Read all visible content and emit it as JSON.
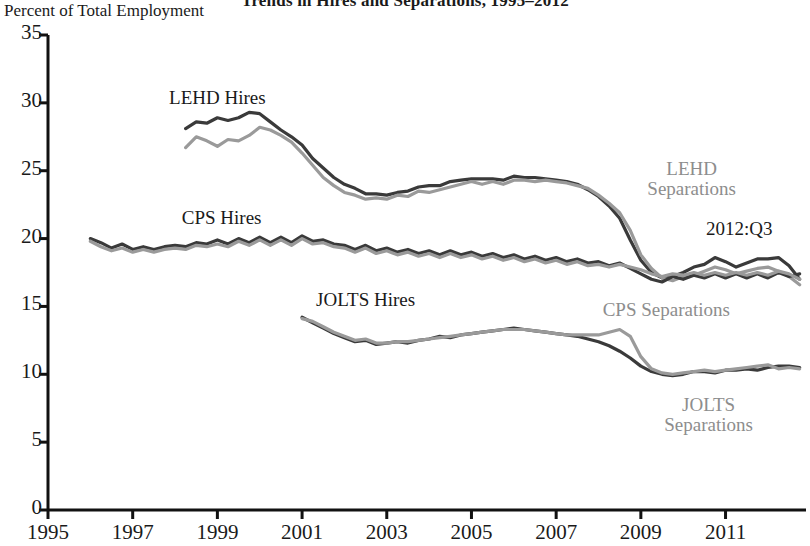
{
  "chart_data": {
    "type": "line",
    "title": "Trends in Hires and Separations, 1995–2012",
    "ylabel": "Percent of Total Employment",
    "xlabel": "",
    "xlim": [
      1995,
      2012.9
    ],
    "ylim": [
      0,
      35
    ],
    "yticks": [
      0,
      5,
      10,
      15,
      20,
      25,
      30,
      35
    ],
    "xticks": [
      1995,
      1997,
      1999,
      2001,
      2003,
      2005,
      2007,
      2009,
      2011
    ],
    "ytick_labels": [
      "0",
      "5",
      "10",
      "15",
      "20",
      "25",
      "30",
      "35"
    ],
    "xtick_labels": [
      "1995",
      "1997",
      "1999",
      "2001",
      "2003",
      "2005",
      "2007",
      "2009",
      "2011"
    ],
    "grid": false,
    "legend_position": "inline-annotations",
    "colors": {
      "hires": "#3a3a3a",
      "separations": "#9a9a9a",
      "axis": "#111111"
    },
    "annotations": [
      {
        "text": "2012:Q3",
        "x": 2011.6,
        "y": 20.6,
        "color": "#1a1a1a"
      }
    ],
    "series": [
      {
        "name": "LEHD Hires",
        "color": "#3a3a3a",
        "label_x": 1999.0,
        "label_y": 30.2,
        "x": [
          1998.25,
          1998.5,
          1998.75,
          1999.0,
          1999.25,
          1999.5,
          1999.75,
          2000.0,
          2000.25,
          2000.5,
          2000.75,
          2001.0,
          2001.25,
          2001.5,
          2001.75,
          2002.0,
          2002.25,
          2002.5,
          2002.75,
          2003.0,
          2003.25,
          2003.5,
          2003.75,
          2004.0,
          2004.25,
          2004.5,
          2004.75,
          2005.0,
          2005.25,
          2005.5,
          2005.75,
          2006.0,
          2006.25,
          2006.5,
          2006.75,
          2007.0,
          2007.25,
          2007.5,
          2007.75,
          2008.0,
          2008.25,
          2008.5,
          2008.75,
          2009.0,
          2009.25,
          2009.5,
          2009.75,
          2010.0,
          2010.25,
          2010.5,
          2010.75,
          2011.0,
          2011.25,
          2011.5,
          2011.75,
          2012.0,
          2012.25,
          2012.5,
          2012.75
        ],
        "y": [
          28.1,
          28.6,
          28.5,
          28.9,
          28.7,
          28.9,
          29.3,
          29.2,
          28.6,
          28.0,
          27.5,
          26.9,
          25.9,
          25.2,
          24.5,
          24.0,
          23.7,
          23.3,
          23.3,
          23.2,
          23.4,
          23.5,
          23.8,
          23.9,
          23.9,
          24.2,
          24.3,
          24.4,
          24.4,
          24.4,
          24.3,
          24.6,
          24.5,
          24.5,
          24.4,
          24.3,
          24.2,
          24.0,
          23.6,
          23.1,
          22.4,
          21.5,
          19.9,
          18.4,
          17.5,
          17.1,
          17.2,
          17.5,
          17.9,
          18.1,
          18.6,
          18.3,
          17.9,
          18.2,
          18.5,
          18.5,
          18.6,
          18.0,
          17.0
        ]
      },
      {
        "name": "LEHD Separations",
        "color": "#9a9a9a",
        "label_x": 2010.2,
        "label_y": 25.0,
        "label_lines": [
          "LEHD",
          "Separations"
        ],
        "x": [
          1998.25,
          1998.5,
          1998.75,
          1999.0,
          1999.25,
          1999.5,
          1999.75,
          2000.0,
          2000.25,
          2000.5,
          2000.75,
          2001.0,
          2001.25,
          2001.5,
          2001.75,
          2002.0,
          2002.25,
          2002.5,
          2002.75,
          2003.0,
          2003.25,
          2003.5,
          2003.75,
          2004.0,
          2004.25,
          2004.5,
          2004.75,
          2005.0,
          2005.25,
          2005.5,
          2005.75,
          2006.0,
          2006.25,
          2006.5,
          2006.75,
          2007.0,
          2007.25,
          2007.5,
          2007.75,
          2008.0,
          2008.25,
          2008.5,
          2008.75,
          2009.0,
          2009.25,
          2009.5,
          2009.75,
          2010.0,
          2010.25,
          2010.5,
          2010.75,
          2011.0,
          2011.25,
          2011.5,
          2011.75,
          2012.0,
          2012.25,
          2012.5,
          2012.75
        ],
        "y": [
          26.7,
          27.5,
          27.2,
          26.8,
          27.3,
          27.2,
          27.6,
          28.2,
          28.0,
          27.6,
          27.1,
          26.3,
          25.4,
          24.5,
          23.9,
          23.4,
          23.2,
          22.9,
          23.0,
          22.9,
          23.2,
          23.1,
          23.5,
          23.4,
          23.6,
          23.8,
          24.0,
          24.2,
          24.0,
          24.2,
          24.0,
          24.3,
          24.3,
          24.2,
          24.3,
          24.2,
          24.1,
          23.9,
          23.7,
          23.2,
          22.6,
          21.9,
          20.6,
          18.8,
          17.8,
          17.1,
          16.9,
          17.2,
          17.3,
          17.6,
          17.9,
          17.7,
          17.4,
          17.6,
          17.8,
          17.9,
          17.6,
          17.2,
          16.6
        ]
      },
      {
        "name": "CPS Hires",
        "color": "#3a3a3a",
        "label_x": 1999.1,
        "label_y": 21.4,
        "x": [
          1996.0,
          1996.25,
          1996.5,
          1996.75,
          1997.0,
          1997.25,
          1997.5,
          1997.75,
          1998.0,
          1998.25,
          1998.5,
          1998.75,
          1999.0,
          1999.25,
          1999.5,
          1999.75,
          2000.0,
          2000.25,
          2000.5,
          2000.75,
          2001.0,
          2001.25,
          2001.5,
          2001.75,
          2002.0,
          2002.25,
          2002.5,
          2002.75,
          2003.0,
          2003.25,
          2003.5,
          2003.75,
          2004.0,
          2004.25,
          2004.5,
          2004.75,
          2005.0,
          2005.25,
          2005.5,
          2005.75,
          2006.0,
          2006.25,
          2006.5,
          2006.75,
          2007.0,
          2007.25,
          2007.5,
          2007.75,
          2008.0,
          2008.25,
          2008.5,
          2008.75,
          2009.0,
          2009.25,
          2009.5,
          2009.75,
          2010.0,
          2010.25,
          2010.5,
          2010.75,
          2011.0,
          2011.25,
          2011.5,
          2011.75,
          2012.0,
          2012.25,
          2012.5,
          2012.75
        ],
        "y": [
          20.0,
          19.7,
          19.3,
          19.6,
          19.2,
          19.4,
          19.2,
          19.4,
          19.5,
          19.4,
          19.7,
          19.6,
          19.9,
          19.6,
          20.0,
          19.7,
          20.1,
          19.7,
          20.1,
          19.7,
          20.2,
          19.8,
          19.9,
          19.6,
          19.5,
          19.2,
          19.5,
          19.1,
          19.3,
          19.0,
          19.2,
          18.9,
          19.1,
          18.8,
          19.1,
          18.8,
          19.0,
          18.7,
          18.9,
          18.6,
          18.8,
          18.5,
          18.7,
          18.4,
          18.6,
          18.3,
          18.5,
          18.2,
          18.3,
          18.0,
          18.2,
          17.8,
          17.4,
          17.0,
          16.8,
          17.2,
          17.0,
          17.3,
          17.1,
          17.4,
          17.1,
          17.4,
          17.1,
          17.4,
          17.1,
          17.5,
          17.2,
          17.4
        ]
      },
      {
        "name": "CPS Separations",
        "color": "#9a9a9a",
        "label_x": 2009.6,
        "label_y": 14.6,
        "x": [
          1996.0,
          1996.25,
          1996.5,
          1996.75,
          1997.0,
          1997.25,
          1997.5,
          1997.75,
          1998.0,
          1998.25,
          1998.5,
          1998.75,
          1999.0,
          1999.25,
          1999.5,
          1999.75,
          2000.0,
          2000.25,
          2000.5,
          2000.75,
          2001.0,
          2001.25,
          2001.5,
          2001.75,
          2002.0,
          2002.25,
          2002.5,
          2002.75,
          2003.0,
          2003.25,
          2003.5,
          2003.75,
          2004.0,
          2004.25,
          2004.5,
          2004.75,
          2005.0,
          2005.25,
          2005.5,
          2005.75,
          2006.0,
          2006.25,
          2006.5,
          2006.75,
          2007.0,
          2007.25,
          2007.5,
          2007.75,
          2008.0,
          2008.25,
          2008.5,
          2008.75,
          2009.0,
          2009.25,
          2009.5,
          2009.75,
          2010.0,
          2010.25,
          2010.5,
          2010.75,
          2011.0,
          2011.25,
          2011.5,
          2011.75,
          2012.0,
          2012.25,
          2012.5,
          2012.75
        ],
        "y": [
          19.8,
          19.4,
          19.1,
          19.3,
          19.0,
          19.2,
          19.0,
          19.2,
          19.3,
          19.2,
          19.5,
          19.4,
          19.6,
          19.4,
          19.8,
          19.5,
          19.9,
          19.5,
          19.9,
          19.5,
          20.0,
          19.6,
          19.7,
          19.4,
          19.3,
          19.0,
          19.3,
          18.9,
          19.1,
          18.8,
          19.0,
          18.7,
          18.9,
          18.6,
          18.9,
          18.6,
          18.8,
          18.5,
          18.7,
          18.4,
          18.6,
          18.3,
          18.5,
          18.2,
          18.4,
          18.1,
          18.3,
          18.0,
          18.1,
          17.9,
          18.1,
          17.9,
          17.7,
          17.4,
          17.2,
          17.4,
          17.3,
          17.5,
          17.3,
          17.5,
          17.3,
          17.5,
          17.3,
          17.5,
          17.3,
          17.6,
          17.4,
          17.0
        ]
      },
      {
        "name": "JOLTS Hires",
        "color": "#3a3a3a",
        "label_x": 2002.5,
        "label_y": 15.3,
        "x": [
          2001.0,
          2001.25,
          2001.5,
          2001.75,
          2002.0,
          2002.25,
          2002.5,
          2002.75,
          2003.0,
          2003.25,
          2003.5,
          2003.75,
          2004.0,
          2004.25,
          2004.5,
          2004.75,
          2005.0,
          2005.25,
          2005.5,
          2005.75,
          2006.0,
          2006.25,
          2006.5,
          2006.75,
          2007.0,
          2007.25,
          2007.5,
          2007.75,
          2008.0,
          2008.25,
          2008.5,
          2008.75,
          2009.0,
          2009.25,
          2009.5,
          2009.75,
          2010.0,
          2010.25,
          2010.5,
          2010.75,
          2011.0,
          2011.25,
          2011.5,
          2011.75,
          2012.0,
          2012.25,
          2012.5,
          2012.75
        ],
        "y": [
          14.2,
          13.8,
          13.4,
          13.0,
          12.7,
          12.4,
          12.5,
          12.2,
          12.3,
          12.4,
          12.3,
          12.5,
          12.6,
          12.8,
          12.7,
          12.9,
          13.0,
          13.1,
          13.2,
          13.3,
          13.4,
          13.3,
          13.2,
          13.1,
          13.0,
          12.9,
          12.8,
          12.6,
          12.4,
          12.1,
          11.7,
          11.2,
          10.6,
          10.2,
          10.0,
          9.9,
          10.0,
          10.2,
          10.2,
          10.1,
          10.3,
          10.3,
          10.4,
          10.3,
          10.5,
          10.6,
          10.6,
          10.5
        ]
      },
      {
        "name": "JOLTS Separations",
        "color": "#9a9a9a",
        "label_x": 2010.6,
        "label_y": 7.6,
        "label_lines": [
          "JOLTS",
          "Separations"
        ],
        "x": [
          2001.0,
          2001.25,
          2001.5,
          2001.75,
          2002.0,
          2002.25,
          2002.5,
          2002.75,
          2003.0,
          2003.25,
          2003.5,
          2003.75,
          2004.0,
          2004.25,
          2004.5,
          2004.75,
          2005.0,
          2005.25,
          2005.5,
          2005.75,
          2006.0,
          2006.25,
          2006.5,
          2006.75,
          2007.0,
          2007.25,
          2007.5,
          2007.75,
          2008.0,
          2008.25,
          2008.5,
          2008.75,
          2009.0,
          2009.25,
          2009.5,
          2009.75,
          2010.0,
          2010.25,
          2010.5,
          2010.75,
          2011.0,
          2011.25,
          2011.5,
          2011.75,
          2012.0,
          2012.25,
          2012.5,
          2012.75
        ],
        "y": [
          14.1,
          13.9,
          13.5,
          13.1,
          12.8,
          12.5,
          12.6,
          12.3,
          12.3,
          12.4,
          12.4,
          12.5,
          12.6,
          12.7,
          12.8,
          12.9,
          13.0,
          13.1,
          13.2,
          13.3,
          13.3,
          13.3,
          13.2,
          13.1,
          13.0,
          12.9,
          12.9,
          12.9,
          12.9,
          13.1,
          13.3,
          12.8,
          11.3,
          10.4,
          10.1,
          10.0,
          10.1,
          10.2,
          10.3,
          10.2,
          10.3,
          10.4,
          10.5,
          10.6,
          10.7,
          10.4,
          10.5,
          10.4
        ]
      }
    ]
  }
}
